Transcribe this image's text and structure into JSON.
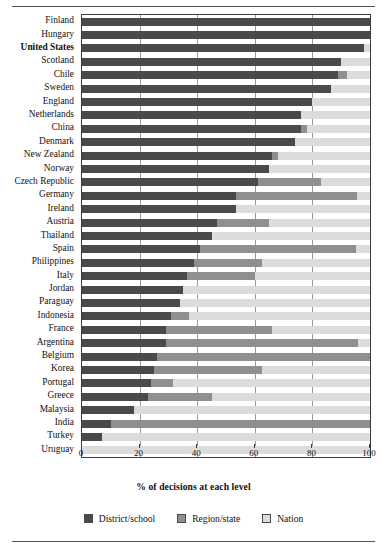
{
  "chart_data": {
    "type": "bar",
    "subtype": "stacked-horizontal-bar",
    "title": "",
    "xlabel": "% of decisions at each level",
    "ylabel": "",
    "xlim": [
      0,
      100
    ],
    "xticks": [
      0,
      20,
      40,
      60,
      80,
      100
    ],
    "xtick_labels": [
      "0",
      "20",
      "40",
      "60",
      "80",
      "100"
    ],
    "grid": "vertical",
    "legend_position": "bottom-center",
    "stack_order": [
      "District/school",
      "Region/state",
      "Nation"
    ],
    "series": [
      {
        "name": "District/school",
        "color": "#4a4a4a",
        "values": [
          100,
          100,
          98,
          90,
          89,
          86.5,
          80,
          76,
          76,
          74,
          66,
          65,
          61,
          53.5,
          53.5,
          47,
          45,
          41,
          39,
          36.5,
          35,
          34,
          31,
          29,
          29,
          26,
          25,
          24,
          23,
          18,
          10,
          7,
          0
        ]
      },
      {
        "name": "Region/state",
        "color": "#8f8f8f",
        "values": [
          0,
          0,
          0,
          0,
          3,
          0,
          0,
          0,
          2,
          0,
          2,
          0,
          22,
          42,
          0,
          18,
          0,
          54,
          23.5,
          23.5,
          0,
          0,
          6,
          37,
          67,
          74,
          37.5,
          7.5,
          22,
          0,
          90,
          0,
          0
        ]
      },
      {
        "name": "Nation",
        "color": "#dcdcdc",
        "values": [
          0,
          0,
          2,
          10,
          8,
          13.5,
          20,
          24,
          22,
          26,
          32,
          35,
          17,
          4.5,
          46.5,
          35,
          55,
          5,
          37.5,
          40,
          65,
          66,
          63,
          34,
          4,
          0,
          37.5,
          68.5,
          55,
          82,
          0,
          93,
          100
        ]
      }
    ],
    "categories": [
      "Finland",
      "Hungary",
      "United States",
      "Scotland",
      "Chile",
      "Sweden",
      "England",
      "Netherlands",
      "China",
      "Denmark",
      "New Zealand",
      "Norway",
      "Czech Republic",
      "Germany",
      "Ireland",
      "Austria",
      "Thailand",
      "Spain",
      "Philippines",
      "Italy",
      "Jordan",
      "Paraguay",
      "Indonesia",
      "France",
      "Argentina",
      "Belgium",
      "Korea",
      "Portugal",
      "Greece",
      "Malaysia",
      "India",
      "Turkey",
      "Uruguay"
    ],
    "emphasized_categories": [
      "United States"
    ]
  },
  "legend": {
    "items": [
      {
        "label": "District/school",
        "color": "#4a4a4a"
      },
      {
        "label": "Region/state",
        "color": "#8f8f8f"
      },
      {
        "label": "Nation",
        "color": "#dcdcdc"
      }
    ]
  }
}
